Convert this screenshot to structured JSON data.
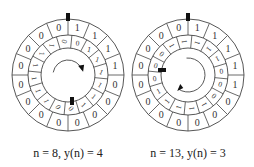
{
  "diagrams": [
    {
      "id": "left",
      "center": [
        68,
        75
      ],
      "outer_radius": 56,
      "mid_radius": 40,
      "inner_radius": 27,
      "segments": 16,
      "outer_ring": [
        "1",
        "1",
        "1",
        "1",
        "0",
        "0",
        "0",
        "0",
        "0",
        "0",
        "0",
        "0",
        "0",
        "0",
        "0",
        "0"
      ],
      "inner_ring": [
        "0",
        "1",
        "1",
        "1",
        "1",
        "1",
        "1",
        "0",
        "0",
        "1",
        "1",
        "1",
        "1",
        "1",
        "1",
        "0"
      ],
      "top_marker": true,
      "inner_marker_angle": 180,
      "arrow": "clockwise-top",
      "caption": "n = 8, y(n) = 4",
      "caption_x": 68
    },
    {
      "id": "right",
      "center": [
        188,
        75
      ],
      "outer_radius": 56,
      "mid_radius": 40,
      "inner_radius": 27,
      "segments": 16,
      "outer_ring": [
        "1",
        "1",
        "1",
        "1",
        "1",
        "0",
        "0",
        "0",
        "0",
        "0",
        "0",
        "0",
        "0",
        "0",
        "0",
        "0"
      ],
      "inner_ring": [
        "1",
        "1",
        "1",
        "0",
        "0",
        "0",
        "1",
        "1",
        "1",
        "1",
        "1",
        "0",
        "0",
        "0",
        "1",
        "1"
      ],
      "top_marker": true,
      "inner_marker_angle": 270,
      "arrow": "clockwise-right",
      "caption": "n = 13, y(n) = 3",
      "caption_x": 188
    }
  ],
  "colors": {
    "line": "#444444",
    "marker": "#111111",
    "text": "#333333"
  }
}
